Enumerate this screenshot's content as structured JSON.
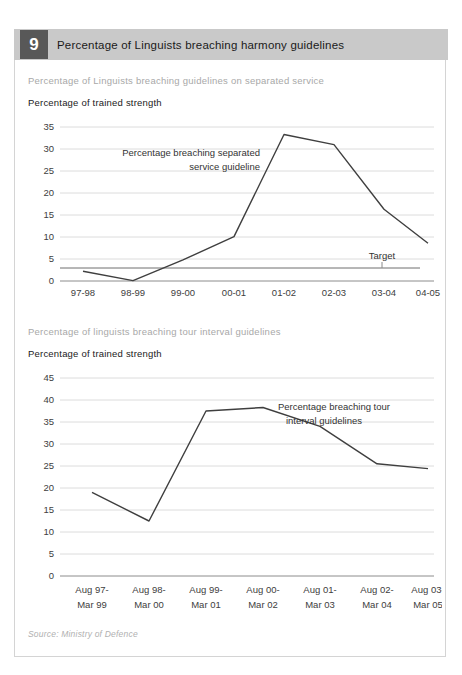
{
  "header": {
    "badge_number": "9",
    "title": "Percentage of Linguists breaching harmony guidelines",
    "badge_color": "#585858",
    "band_color": "#c9c9c9"
  },
  "source": "Source: Ministry of Defence",
  "chart_data": [
    {
      "type": "line",
      "title": "Percentage of Linguists breaching guidelines on separated service",
      "ylabel": "Percentage of trained strength",
      "xlabel": "",
      "categories": [
        "97-98",
        "98-99",
        "99-00",
        "00-01",
        "01-02",
        "02-03",
        "03-04",
        "04-05"
      ],
      "series": [
        {
          "name": "Percentage breaching separated service guideline",
          "values": [
            2.2,
            0.1,
            4.8,
            10.1,
            33.3,
            31.0,
            16.3,
            8.6
          ],
          "color": "#3f3f3f"
        }
      ],
      "target_line": {
        "label": "Target",
        "value": 3.0,
        "color": "#6e6e6e"
      },
      "annotations": [
        {
          "text_line1": "Percentage breaching separated",
          "text_line2": "service guideline"
        }
      ],
      "ylim": [
        0,
        35
      ],
      "yticks": [
        0,
        5,
        10,
        15,
        20,
        25,
        30,
        35
      ],
      "grid": true,
      "legend": "none"
    },
    {
      "type": "line",
      "title": "Percentage of linguists breaching tour interval guidelines",
      "ylabel": "Percentage of trained strength",
      "xlabel": "",
      "categories": [
        "Aug 97-\nMar 99",
        "Aug 98-\nMar 00",
        "Aug 99-\nMar 01",
        "Aug 00-\nMar 02",
        "Aug 01-\nMar 03",
        "Aug 02-\nMar 04",
        "Aug 03-\nMar 05"
      ],
      "categories_flat": [
        "Aug 97- Mar 99",
        "Aug 98- Mar 00",
        "Aug 99- Mar 01",
        "Aug 00- Mar 02",
        "Aug 01- Mar 03",
        "Aug 02- Mar 04",
        "Aug 03- Mar 05"
      ],
      "series": [
        {
          "name": "Percentage breaching tour interval guidelines",
          "values": [
            19.0,
            12.5,
            37.5,
            38.3,
            34.0,
            25.5,
            24.4
          ],
          "color": "#3f3f3f"
        }
      ],
      "annotations": [
        {
          "text_line1": "Percentage breaching tour",
          "text_line2": "interval guidelines"
        }
      ],
      "ylim": [
        0,
        45
      ],
      "yticks": [
        0,
        5,
        10,
        15,
        20,
        25,
        30,
        35,
        40,
        45
      ],
      "grid": true,
      "legend": "none"
    }
  ],
  "chart1_ticks": {
    "y": [
      "0",
      "5",
      "10",
      "15",
      "20",
      "25",
      "30",
      "35"
    ],
    "x": [
      "97-98",
      "98-99",
      "99-00",
      "00-01",
      "01-02",
      "02-03",
      "03-04",
      "04-05"
    ]
  },
  "chart2_ticks": {
    "y": [
      "0",
      "5",
      "10",
      "15",
      "20",
      "25",
      "30",
      "35",
      "40",
      "45"
    ],
    "x_top": [
      "Aug 97-",
      "Aug 98-",
      "Aug 99-",
      "Aug 00-",
      "Aug 01-",
      "Aug 02-",
      "Aug 03-"
    ],
    "x_bottom": [
      "Mar 99",
      "Mar 00",
      "Mar 01",
      "Mar 02",
      "Mar 03",
      "Mar 04",
      "Mar 05"
    ]
  }
}
